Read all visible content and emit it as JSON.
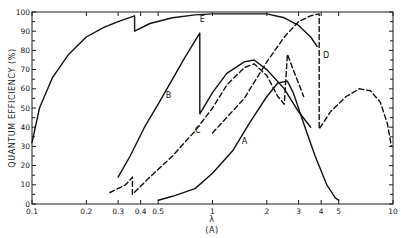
{
  "chart_data": {
    "type": "line",
    "title": "",
    "xlabel": "λ",
    "xlabel_unit": "(A)",
    "ylabel": "QUANTUM EFFICIENCY (%)",
    "xscale": "log",
    "xlim": [
      0.1,
      10
    ],
    "ylim": [
      0,
      100
    ],
    "grid": false,
    "legend": "inline curve labels",
    "x_ticks": [
      {
        "value": 0.1,
        "label": "0.1"
      },
      {
        "value": 0.2,
        "label": "0.2"
      },
      {
        "value": 0.3,
        "label": "0.3"
      },
      {
        "value": 0.4,
        "label": "0.4"
      },
      {
        "value": 0.5,
        "label": "0.5"
      },
      {
        "value": 1,
        "label": "1"
      },
      {
        "value": 2,
        "label": "2"
      },
      {
        "value": 3,
        "label": "3"
      },
      {
        "value": 4,
        "label": "4"
      },
      {
        "value": 5,
        "label": "5"
      },
      {
        "value": 10,
        "label": "10"
      }
    ],
    "y_ticks": [
      {
        "value": 0,
        "label": "0"
      },
      {
        "value": 10,
        "label": "10"
      },
      {
        "value": 20,
        "label": "20"
      },
      {
        "value": 30,
        "label": "30"
      },
      {
        "value": 40,
        "label": "40"
      },
      {
        "value": 50,
        "label": "50"
      },
      {
        "value": 60,
        "label": "60"
      },
      {
        "value": 70,
        "label": "70"
      },
      {
        "value": 80,
        "label": "80"
      },
      {
        "value": 90,
        "label": "90"
      },
      {
        "value": 100,
        "label": "100"
      }
    ],
    "series": [
      {
        "name": "E",
        "style": "solid",
        "label_at": [
          0.85,
          95
        ],
        "points": [
          [
            0.1,
            32
          ],
          [
            0.11,
            50
          ],
          [
            0.13,
            66
          ],
          [
            0.16,
            78
          ],
          [
            0.2,
            87
          ],
          [
            0.25,
            92
          ],
          [
            0.3,
            95
          ],
          [
            0.37,
            98
          ],
          [
            0.37,
            90
          ],
          [
            0.45,
            94
          ],
          [
            0.6,
            97
          ],
          [
            0.8,
            98.5
          ],
          [
            1.0,
            99
          ],
          [
            2.0,
            99
          ],
          [
            2.5,
            97
          ],
          [
            3.0,
            93
          ],
          [
            3.5,
            87
          ],
          [
            3.8,
            82
          ]
        ]
      },
      {
        "name": "B",
        "style": "solid",
        "label_at": [
          0.55,
          55
        ],
        "points": [
          [
            0.3,
            14
          ],
          [
            0.35,
            25
          ],
          [
            0.42,
            40
          ],
          [
            0.5,
            52
          ],
          [
            0.6,
            65
          ],
          [
            0.7,
            76
          ],
          [
            0.8,
            85
          ],
          [
            0.85,
            89
          ],
          [
            0.85,
            47
          ],
          [
            1.0,
            58
          ],
          [
            1.2,
            68
          ],
          [
            1.5,
            74
          ],
          [
            1.7,
            75
          ],
          [
            2.0,
            70
          ],
          [
            2.5,
            60
          ],
          [
            3.0,
            48
          ],
          [
            3.5,
            40
          ]
        ]
      },
      {
        "name": "C",
        "style": "dashed",
        "label_at": [
          0.8,
          37
        ],
        "points": [
          [
            0.27,
            6
          ],
          [
            0.33,
            10
          ],
          [
            0.36,
            14
          ],
          [
            0.36,
            5
          ],
          [
            0.45,
            14
          ],
          [
            0.6,
            25
          ],
          [
            0.8,
            38
          ],
          [
            1.0,
            50
          ],
          [
            1.2,
            62
          ],
          [
            1.5,
            71
          ],
          [
            1.7,
            73
          ],
          [
            2.0,
            67
          ],
          [
            2.3,
            56
          ],
          [
            2.5,
            52
          ],
          [
            2.6,
            78
          ],
          [
            2.8,
            70
          ],
          [
            3.2,
            56
          ]
        ]
      },
      {
        "name": "D",
        "style": "dashed",
        "label_at": [
          4.1,
          76
        ],
        "points": [
          [
            1.0,
            37
          ],
          [
            1.5,
            55
          ],
          [
            2.0,
            74
          ],
          [
            2.5,
            87
          ],
          [
            3.0,
            95
          ],
          [
            3.5,
            98
          ],
          [
            3.9,
            99
          ],
          [
            3.9,
            39
          ],
          [
            4.5,
            48
          ],
          [
            5.5,
            56
          ],
          [
            6.5,
            60
          ],
          [
            7.5,
            59
          ],
          [
            8.5,
            53
          ],
          [
            9.3,
            42
          ],
          [
            9.8,
            30
          ]
        ]
      },
      {
        "name": "A",
        "style": "solid",
        "label_at": [
          1.45,
          31
        ],
        "points": [
          [
            0.5,
            2
          ],
          [
            0.6,
            4
          ],
          [
            0.8,
            8
          ],
          [
            1.0,
            16
          ],
          [
            1.3,
            28
          ],
          [
            1.6,
            42
          ],
          [
            2.0,
            56
          ],
          [
            2.3,
            63
          ],
          [
            2.6,
            64
          ],
          [
            2.8,
            58
          ],
          [
            3.2,
            42
          ],
          [
            3.7,
            25
          ],
          [
            4.3,
            10
          ],
          [
            4.8,
            3
          ],
          [
            5.0,
            2
          ]
        ]
      }
    ]
  }
}
